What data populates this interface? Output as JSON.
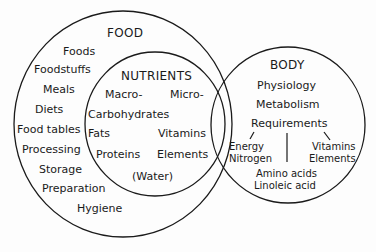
{
  "diagram": {
    "type": "venn",
    "sets": {
      "food": {
        "title": "FOOD",
        "items": [
          "Foods",
          "Foodstuffs",
          "Meals",
          "Diets",
          "Food tables",
          "Processing",
          "Storage",
          "Preparation",
          "Hygiene"
        ]
      },
      "nutrients": {
        "title": "NUTRIENTS",
        "columns": [
          "Macro-",
          "Micro-"
        ],
        "macro_items": [
          "Carbohydrates",
          "Fats",
          "Proteins"
        ],
        "micro_items": [
          "Vitamins",
          "Elements"
        ],
        "other": "(Water)"
      },
      "body": {
        "title": "BODY",
        "items": [
          "Physiology",
          "Metabolism",
          "Requirements"
        ],
        "requirement_branches": {
          "left": [
            "Energy",
            "Nitrogen"
          ],
          "right": [
            "Vitamins",
            "Elements"
          ],
          "center": [
            "Amino acids",
            "Linoleic acid"
          ]
        }
      }
    },
    "colors": {
      "line": "#1a1a1a",
      "background": "#fdfdfd"
    }
  }
}
